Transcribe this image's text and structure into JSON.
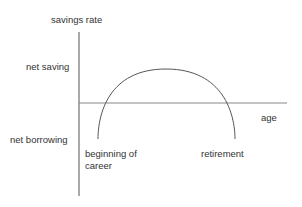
{
  "diagram": {
    "y_axis_label": "savings rate",
    "x_axis_label": "age",
    "y_region_labels": {
      "above": "net saving",
      "below": "net borrowing"
    },
    "curve_endpoint_labels": {
      "start_line1": "beginning of",
      "start_line2": "career",
      "end": "retirement"
    },
    "colors": {
      "line": "#555555",
      "axis": "#777777",
      "text": "#333333"
    }
  }
}
